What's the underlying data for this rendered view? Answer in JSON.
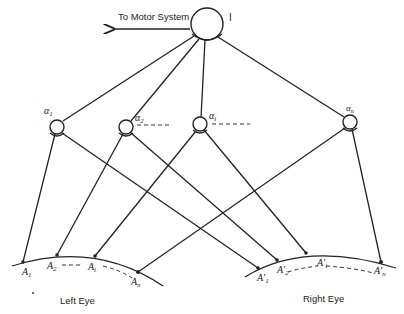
{
  "motor": {
    "label": "I",
    "output_label": "To Motor System"
  },
  "interneurons": [
    {
      "label": "α",
      "sub": "1"
    },
    {
      "label": "α",
      "sub": "2"
    },
    {
      "label": "α",
      "sub": "i"
    },
    {
      "label": "α",
      "sub": "n"
    }
  ],
  "left_eye": {
    "title": "Left Eye",
    "points": [
      {
        "label": "A",
        "sub": "1"
      },
      {
        "label": "A",
        "sub": "2"
      },
      {
        "label": "A",
        "sub": "i"
      },
      {
        "label": "A",
        "sub": "n"
      }
    ]
  },
  "right_eye": {
    "title": "Right Eye",
    "points": [
      {
        "label": "A'",
        "sub": "1"
      },
      {
        "label": "A'",
        "sub": "2"
      },
      {
        "label": "A'",
        "sub": "i"
      },
      {
        "label": "A'",
        "sub": "n"
      }
    ]
  },
  "colors": {
    "ink": "#222222",
    "background": "#ffffff"
  }
}
